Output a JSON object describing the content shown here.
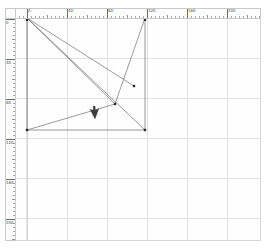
{
  "app": {
    "title": "Vector Drawing Canvas",
    "background_color": "#ffffff"
  },
  "rulers": {
    "units": "px",
    "horizontal": {
      "name": "horizontal-ruler",
      "origin_px": 11,
      "major_spacing_px": 40,
      "minor_spacing_px": 4,
      "labels": [
        "0",
        "40",
        "80",
        "120",
        "160",
        "200"
      ],
      "label_positions_px": [
        11,
        51,
        91,
        131,
        171,
        211
      ],
      "tick_color": "#6d6d6d",
      "background_color": "#fdfdfd"
    },
    "vertical": {
      "name": "vertical-ruler",
      "origin_px": 0,
      "major_spacing_px": 40,
      "minor_spacing_px": 4,
      "labels": [
        "0",
        "40",
        "80",
        "120",
        "160",
        "200"
      ],
      "label_positions_px": [
        0,
        40,
        80,
        120,
        160,
        200
      ],
      "tick_color": "#6d6d6d",
      "background_color": "#fdfdfd"
    }
  },
  "canvas": {
    "name": "drawing-canvas",
    "width_px": 245,
    "height_px": 222,
    "grid": {
      "enabled": true,
      "major_spacing_px": 40,
      "major_color": "#e2e2e2",
      "minor_dot_spacing_px": 8,
      "minor_dot_color": "#ebebeb",
      "page_edge_color": "#c6c6c6"
    },
    "stroke_color": "#6f6f6f",
    "node_color": "#2b2b2b",
    "shape_name": "polyline-fan"
  },
  "chart_data": {
    "type": "scatter",
    "title": "",
    "xlabel": "",
    "ylabel": "",
    "xlim": [
      0,
      245
    ],
    "ylim": [
      0,
      222
    ],
    "grid": true,
    "legend": "none",
    "nodes": [
      {
        "id": "n0",
        "label": "origin",
        "x": 11,
        "y": -1
      },
      {
        "id": "n1",
        "label": "top-right",
        "x": 129,
        "y": -1
      },
      {
        "id": "n2",
        "label": "bottom-left",
        "x": 11,
        "y": 111
      },
      {
        "id": "n3",
        "label": "bottom-right",
        "x": 129,
        "y": 111
      },
      {
        "id": "n4",
        "label": "mid-junction",
        "x": 99,
        "y": 85
      },
      {
        "id": "n5",
        "label": "free-endpoint",
        "x": 118,
        "y": 67
      }
    ],
    "segments": [
      {
        "from": "n0",
        "to": "n1",
        "kind": "edge"
      },
      {
        "from": "n0",
        "to": "n5",
        "kind": "ray"
      },
      {
        "from": "n0",
        "to": "n4",
        "kind": "ray"
      },
      {
        "from": "n0",
        "to": "n3",
        "kind": "ray"
      },
      {
        "from": "n0",
        "to": "n2",
        "kind": "edge"
      },
      {
        "from": "n2",
        "to": "n4",
        "kind": "edge"
      },
      {
        "from": "n2",
        "to": "n3",
        "kind": "edge"
      },
      {
        "from": "n1",
        "to": "n4",
        "kind": "edge"
      },
      {
        "from": "n3",
        "to": "n1",
        "kind": "edge"
      }
    ]
  },
  "cursor": {
    "name": "arrow-pointer",
    "x": 79,
    "y": 100,
    "icon": "arrow-cursor-icon",
    "color": "#3a3a3a"
  }
}
